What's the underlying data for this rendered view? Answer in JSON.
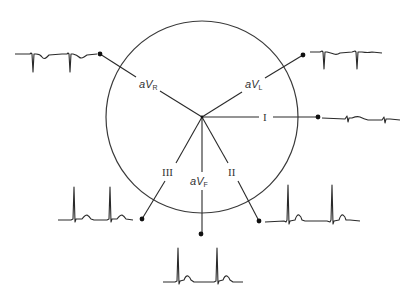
{
  "diagram": {
    "colors": {
      "stroke": "#2a2a2a",
      "background": "#ffffff"
    },
    "circle": {
      "cx": 202,
      "cy": 117,
      "r": 96
    },
    "leads": [
      {
        "id": "aVR",
        "prefix": "a",
        "main": "V",
        "sub": "R",
        "label": "aVR",
        "dot": [
          100,
          54
        ],
        "label_pos": [
          148,
          87
        ]
      },
      {
        "id": "aVL",
        "prefix": "a",
        "main": "V",
        "sub": "L",
        "label": "aVL",
        "dot": [
          303,
          55
        ],
        "label_pos": [
          256,
          87
        ]
      },
      {
        "id": "I",
        "label": "I",
        "dot": [
          318,
          117
        ],
        "label_pos": [
          266,
          121
        ]
      },
      {
        "id": "II",
        "label": "II",
        "dot": [
          259,
          221
        ],
        "label_pos": [
          234,
          174
        ]
      },
      {
        "id": "aVF",
        "prefix": "a",
        "main": "V",
        "sub": "F",
        "label": "aVF",
        "dot": [
          201,
          234
        ],
        "label_pos": [
          201,
          184
        ]
      },
      {
        "id": "III",
        "label": "III",
        "dot": [
          142,
          219
        ],
        "label_pos": [
          168,
          174
        ]
      }
    ],
    "tracings": [
      {
        "lead": "aVR",
        "polarity": "negative QRS, inverted T"
      },
      {
        "lead": "aVL",
        "polarity": "negative QRS"
      },
      {
        "lead": "I",
        "polarity": "nearly isoelectric"
      },
      {
        "lead": "II",
        "polarity": "positive QRS, upright T"
      },
      {
        "lead": "aVF",
        "polarity": "positive QRS, upright T"
      },
      {
        "lead": "III",
        "polarity": "positive QRS, upright T"
      }
    ]
  }
}
